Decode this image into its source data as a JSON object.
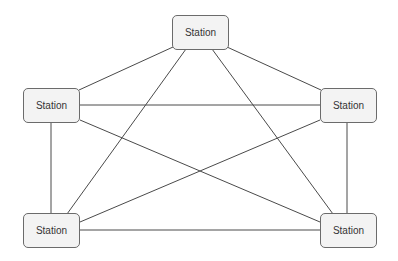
{
  "diagram": {
    "type": "network-topology",
    "nodes": [
      {
        "id": "top",
        "label": "Station",
        "x": 172,
        "y": 15
      },
      {
        "id": "left",
        "label": "Station",
        "x": 23,
        "y": 88
      },
      {
        "id": "right",
        "label": "Station",
        "x": 320,
        "y": 88
      },
      {
        "id": "bottom-left",
        "label": "Station",
        "x": 23,
        "y": 213
      },
      {
        "id": "bottom-right",
        "label": "Station",
        "x": 320,
        "y": 213
      }
    ],
    "edges": [
      {
        "from": "top",
        "to": "left"
      },
      {
        "from": "top",
        "to": "right"
      },
      {
        "from": "top",
        "to": "bottom-left"
      },
      {
        "from": "top",
        "to": "bottom-right"
      },
      {
        "from": "left",
        "to": "right"
      },
      {
        "from": "left",
        "to": "bottom-left"
      },
      {
        "from": "left",
        "to": "bottom-right"
      },
      {
        "from": "right",
        "to": "bottom-left"
      },
      {
        "from": "right",
        "to": "bottom-right"
      },
      {
        "from": "bottom-left",
        "to": "bottom-right"
      }
    ],
    "colors": {
      "node_fill": "#f3f3f3",
      "node_border": "#6b6b6b",
      "edge": "#4a4a4a",
      "text": "#333333"
    }
  }
}
